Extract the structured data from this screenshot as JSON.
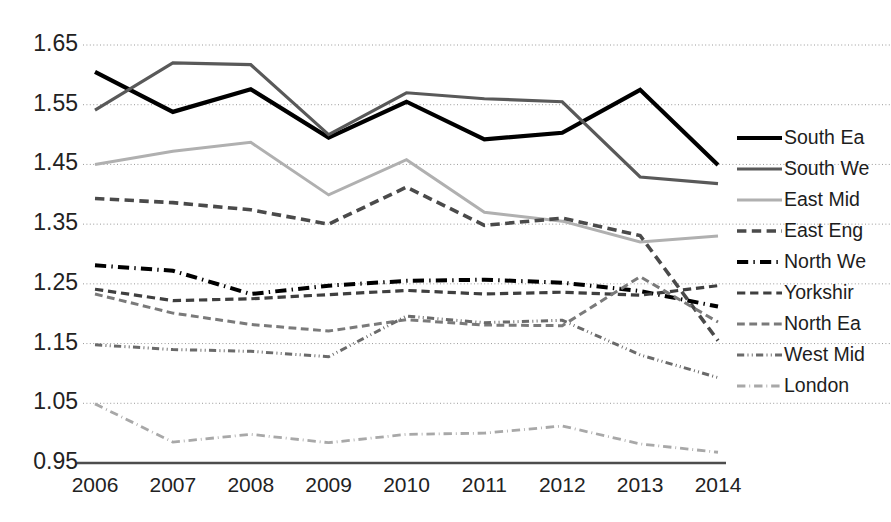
{
  "chart_data": {
    "type": "line",
    "title": "",
    "subtitle": "",
    "xlabel": "",
    "ylabel": "",
    "categories": [
      "2006",
      "2007",
      "2008",
      "2009",
      "2010",
      "2011",
      "2012",
      "2013",
      "2014"
    ],
    "x": [
      2006,
      2007,
      2008,
      2009,
      2010,
      2011,
      2012,
      2013,
      2014
    ],
    "xlim": [
      2006,
      2014
    ],
    "ylim": [
      0.95,
      1.65
    ],
    "yticks": [
      "0.95",
      "1.05",
      "1.15",
      "1.25",
      "1.35",
      "1.45",
      "1.55",
      "1.65"
    ],
    "ytick_values": [
      0.95,
      1.05,
      1.15,
      1.25,
      1.35,
      1.45,
      1.55,
      1.65
    ],
    "grid": true,
    "grid_style": "dotted-horizontal",
    "legend_position": "right",
    "series": [
      {
        "name": "South Ea",
        "style": "solid",
        "color": "#000000",
        "width": 4.2,
        "values": [
          1.605,
          1.538,
          1.576,
          1.495,
          1.555,
          1.492,
          1.503,
          1.575,
          1.449
        ]
      },
      {
        "name": "South We",
        "style": "solid",
        "color": "#595959",
        "width": 3.2,
        "values": [
          1.541,
          1.62,
          1.617,
          1.5,
          1.57,
          1.56,
          1.555,
          1.429,
          1.418
        ]
      },
      {
        "name": "East Mid",
        "style": "solid",
        "color": "#b0b0b0",
        "width": 3.0,
        "values": [
          1.45,
          1.472,
          1.487,
          1.399,
          1.458,
          1.37,
          1.355,
          1.32,
          1.33
        ]
      },
      {
        "name": "East Eng",
        "style": "dashed",
        "color": "#4a4a4a",
        "width": 3.6,
        "values": [
          1.393,
          1.386,
          1.374,
          1.35,
          1.412,
          1.348,
          1.36,
          1.331,
          1.155
        ]
      },
      {
        "name": "North We",
        "style": "dashdot",
        "color": "#000000",
        "width": 4.0,
        "values": [
          1.281,
          1.272,
          1.233,
          1.247,
          1.255,
          1.257,
          1.252,
          1.238,
          1.212
        ]
      },
      {
        "name": "Yorkshir",
        "style": "dashed",
        "color": "#3f3f3f",
        "width": 3.2,
        "values": [
          1.241,
          1.222,
          1.225,
          1.232,
          1.239,
          1.233,
          1.236,
          1.231,
          1.247
        ]
      },
      {
        "name": "North Ea",
        "style": "dashed",
        "color": "#7a7a7a",
        "width": 3.0,
        "values": [
          1.233,
          1.201,
          1.182,
          1.171,
          1.19,
          1.181,
          1.18,
          1.262,
          1.186
        ]
      },
      {
        "name": "West Mid",
        "style": "dashdotdot",
        "color": "#6a6a6a",
        "width": 3.0,
        "values": [
          1.148,
          1.14,
          1.137,
          1.128,
          1.196,
          1.185,
          1.189,
          1.131,
          1.093
        ]
      },
      {
        "name": "London",
        "style": "dashdot-fine",
        "color": "#a8a8a8",
        "width": 2.8,
        "values": [
          1.049,
          0.985,
          0.998,
          0.984,
          0.998,
          1.0,
          1.012,
          0.982,
          0.968
        ]
      }
    ]
  },
  "axes": {
    "ytick_labels": [
      "1.65",
      "1.55",
      "1.45",
      "1.35",
      "1.25",
      "1.15",
      "1.05",
      "0.95"
    ],
    "xtick_labels": [
      "2006",
      "2007",
      "2008",
      "2009",
      "2010",
      "2011",
      "2012",
      "2013",
      "2014"
    ]
  },
  "legend": {
    "entries": [
      {
        "label": "South Ea",
        "icon": "line-solid-thick-black-icon"
      },
      {
        "label": "South We",
        "icon": "line-solid-gray-icon"
      },
      {
        "label": "East Mid",
        "icon": "line-solid-lightgray-icon"
      },
      {
        "label": "East Eng",
        "icon": "line-dashed-darkgray-icon"
      },
      {
        "label": "North We",
        "icon": "line-dashdot-black-icon"
      },
      {
        "label": "Yorkshir",
        "icon": "line-dashed-gray-icon"
      },
      {
        "label": "North Ea",
        "icon": "line-dashed-midgray-icon"
      },
      {
        "label": "West Mid",
        "icon": "line-dashdotdot-gray-icon"
      },
      {
        "label": "London",
        "icon": "line-dashdot-lightgray-icon"
      }
    ]
  }
}
